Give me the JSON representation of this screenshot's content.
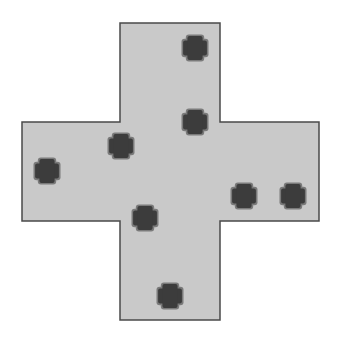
{
  "canvas": {
    "width": 339,
    "height": 343,
    "background": "#ffffff"
  },
  "board": {
    "shape": "cross",
    "fill": "#c9c9c9",
    "stroke": "#4a4a4a",
    "stroke_width": 1.5,
    "vertical_bar": {
      "x": 120,
      "y": 23,
      "width": 100,
      "height": 297
    },
    "horizontal_bar": {
      "x": 22,
      "y": 122,
      "width": 297,
      "height": 99
    }
  },
  "markers": {
    "icon": "plus-icon",
    "size": 27,
    "fill": "#3c3c3c",
    "stroke": "#7a7a7a",
    "items": [
      {
        "id": "marker-1",
        "cx": 195,
        "cy": 48
      },
      {
        "id": "marker-2",
        "cx": 195,
        "cy": 122
      },
      {
        "id": "marker-3",
        "cx": 121,
        "cy": 146
      },
      {
        "id": "marker-4",
        "cx": 47,
        "cy": 171
      },
      {
        "id": "marker-5",
        "cx": 244,
        "cy": 196
      },
      {
        "id": "marker-6",
        "cx": 293,
        "cy": 196
      },
      {
        "id": "marker-7",
        "cx": 145,
        "cy": 218
      },
      {
        "id": "marker-8",
        "cx": 170,
        "cy": 296
      }
    ]
  }
}
